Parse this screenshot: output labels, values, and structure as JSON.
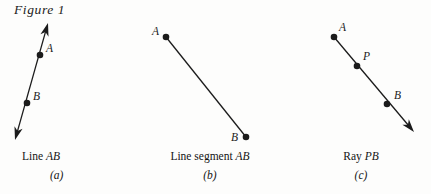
{
  "figure": {
    "title": "Figure 1",
    "background_color": "#fdfdfc",
    "ink_color": "#1b1b1b"
  },
  "panels": [
    {
      "key": "a",
      "letter": "(a)",
      "caption_prefix": "Line ",
      "caption_emphasis": "AB",
      "caption_full": "Line AB",
      "shape_type": "line",
      "arrowheads": "both",
      "geometry": {
        "x1": 15,
        "y1": 140,
        "x2": 48,
        "y2": 23
      },
      "points": [
        {
          "label": "A",
          "x": 40,
          "y": 55,
          "label_dx": 6,
          "label_dy": -11
        },
        {
          "label": "B",
          "x": 27,
          "y": 103,
          "label_dx": 6,
          "label_dy": -11
        }
      ]
    },
    {
      "key": "b",
      "letter": "(b)",
      "caption_prefix": "Line segment ",
      "caption_emphasis": "AB",
      "caption_full": "Line segment AB",
      "shape_type": "segment",
      "arrowheads": "none",
      "geometry": {
        "x1": 26,
        "y1": 37,
        "x2": 106,
        "y2": 137
      },
      "points": [
        {
          "label": "A",
          "x": 26,
          "y": 37,
          "label_dx": -14,
          "label_dy": -10
        },
        {
          "label": "B",
          "x": 106,
          "y": 137,
          "label_dx": -15,
          "label_dy": -4
        }
      ]
    },
    {
      "key": "c",
      "letter": "(c)",
      "caption_prefix": "Ray ",
      "caption_emphasis": "PB",
      "caption_full": "Ray PB",
      "shape_type": "ray",
      "arrowheads": "end",
      "geometry": {
        "x1": 43,
        "y1": 37,
        "x2": 123,
        "y2": 132
      },
      "points": [
        {
          "label": "A",
          "x": 43,
          "y": 37,
          "label_dx": 5,
          "label_dy": -14
        },
        {
          "label": "P",
          "x": 66,
          "y": 66,
          "label_dx": 6,
          "label_dy": -14
        },
        {
          "label": "B",
          "x": 96,
          "y": 104,
          "label_dx": 7,
          "label_dy": -13
        }
      ]
    }
  ]
}
